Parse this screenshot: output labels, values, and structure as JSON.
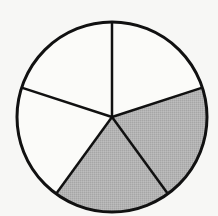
{
  "diagram": {
    "type": "fraction-circle",
    "total_parts": 5,
    "shaded_parts": 2,
    "fraction_label": "2/5",
    "center": [
      112,
      117
    ],
    "radius": 95,
    "start_angle_deg": -90,
    "shaded_indices": [
      1,
      2
    ],
    "colors": {
      "background": "#f7f7f5",
      "shaded": "#b3b3b3",
      "unshaded": "#fbfbf9",
      "stroke": "#111111"
    }
  }
}
